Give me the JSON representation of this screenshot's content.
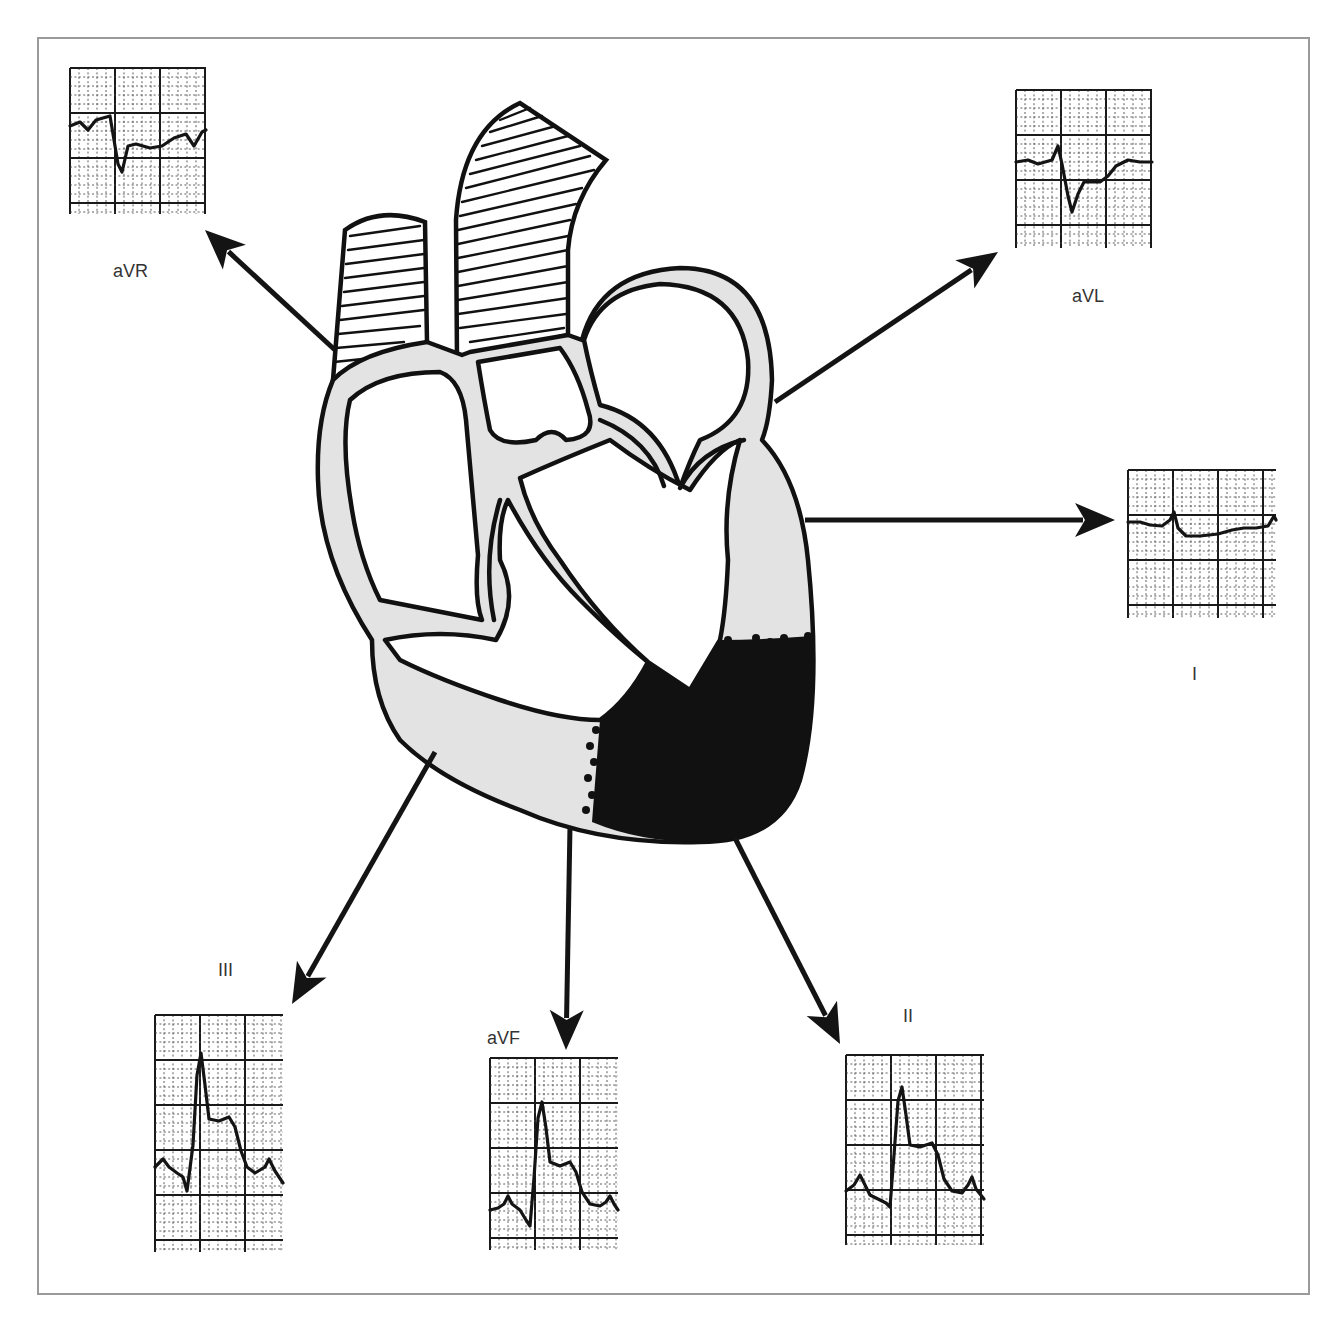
{
  "figure": {
    "frame_color": "#9a9a9a",
    "heart": {
      "myocardium_fill": "#e3e3e3",
      "infarct_fill": "#111111",
      "infarct_region": "inferior / apical left ventricular wall"
    },
    "leads": [
      {
        "id": "aVR",
        "label": "aVR",
        "strip": {
          "x": 70,
          "y": 68,
          "w": 136,
          "h": 146
        },
        "label_pos": {
          "x": 113,
          "y": 277
        },
        "arrow": {
          "x1": 335,
          "y1": 350,
          "x2": 205,
          "y2": 230
        },
        "waveform": "ST depression, deep negative QRS",
        "points": "0,58 10,54 18,62 26,52 40,48 44,72 48,96 52,104 58,78 66,76 80,80 92,78 104,70 116,66 124,78 132,64 136,62"
      },
      {
        "id": "aVL",
        "label": "aVL",
        "strip": {
          "x": 1016,
          "y": 90,
          "w": 136,
          "h": 158
        },
        "label_pos": {
          "x": 1072,
          "y": 302
        },
        "arrow": {
          "x1": 775,
          "y1": 402,
          "x2": 998,
          "y2": 252
        },
        "waveform": "ST depression, negative QRS",
        "points": "0,72 12,70 22,74 36,70 42,56 46,74 52,106 56,122 62,104 68,92 84,92 92,86 100,76 112,70 124,72 136,72"
      },
      {
        "id": "I",
        "label": "I",
        "strip": {
          "x": 1128,
          "y": 470,
          "w": 148,
          "h": 148
        },
        "label_pos": {
          "x": 1192,
          "y": 680
        },
        "arrow": {
          "x1": 805,
          "y1": 520,
          "x2": 1115,
          "y2": 520
        },
        "waveform": "Small QRS, mild ST depression",
        "points": "0,52 12,52 22,55 34,56 42,50 46,42 50,58 58,66 72,66 90,64 104,60 116,58 128,58 140,56 146,46 148,50"
      },
      {
        "id": "III",
        "label": "III",
        "strip": {
          "x": 155,
          "y": 1015,
          "w": 128,
          "h": 237
        },
        "label_pos": {
          "x": 218,
          "y": 976
        },
        "arrow": {
          "x1": 435,
          "y1": 752,
          "x2": 292,
          "y2": 1004
        },
        "waveform": "Tall R wave, marked ST elevation",
        "points": "0,152 8,144 14,152 22,158 28,162 32,176 38,130 42,60 46,38 50,70 54,104 64,106 74,102 80,112 86,136 92,152 100,158 110,152 114,144 120,156 128,168"
      },
      {
        "id": "aVF",
        "label": "aVF",
        "strip": {
          "x": 490,
          "y": 1058,
          "w": 128,
          "h": 192
        },
        "label_pos": {
          "x": 487,
          "y": 1044
        },
        "arrow": {
          "x1": 570,
          "y1": 826,
          "x2": 566,
          "y2": 1050
        },
        "waveform": "Tall R wave, ST elevation",
        "points": "0,152 8,150 14,146 18,138 22,146 30,152 36,162 40,168 44,120 48,60 52,44 56,70 60,104 70,108 80,104 86,114 92,134 100,146 110,148 116,144 120,138 124,146 128,152"
      },
      {
        "id": "II",
        "label": "II",
        "strip": {
          "x": 846,
          "y": 1055,
          "w": 138,
          "h": 190
        },
        "label_pos": {
          "x": 903,
          "y": 1022
        },
        "arrow": {
          "x1": 735,
          "y1": 838,
          "x2": 840,
          "y2": 1044
        },
        "waveform": "Tall R wave, ST elevation",
        "points": "0,136 8,130 14,120 18,128 24,140 32,144 40,148 44,152 48,100 52,46 56,32 60,60 64,90 74,92 86,88 92,100 98,124 106,136 116,138 122,130 126,122 130,134 138,144"
      }
    ]
  }
}
